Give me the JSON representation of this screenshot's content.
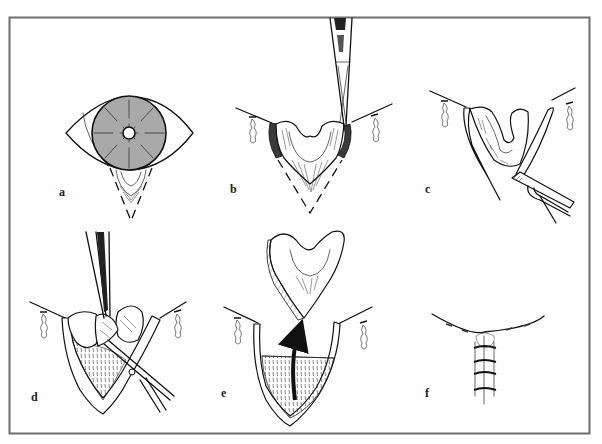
{
  "figure": {
    "border_color": "#6e6e6e",
    "iris_color": "#a9a9a9",
    "arrow_color": "#111111",
    "panels": [
      {
        "id": "a",
        "label": "a",
        "content": "Eye with grey iris; dashed V marking wedge below lower lid"
      },
      {
        "id": "b",
        "label": "b",
        "content": "Lid everted with forceps; dashed V excision outline; traction sutures"
      },
      {
        "id": "c",
        "label": "c",
        "content": "Lid margin incised with scissors/blade; lid segments separated"
      },
      {
        "id": "d",
        "label": "d",
        "content": "Forceps lift tissue; scissors cut along V"
      },
      {
        "id": "e",
        "label": "e",
        "content": "Excised wedge removed (arrow upward); V-shaped defect remains"
      },
      {
        "id": "f",
        "label": "f",
        "content": "Defect closed with interrupted sutures along vertical line"
      }
    ]
  }
}
